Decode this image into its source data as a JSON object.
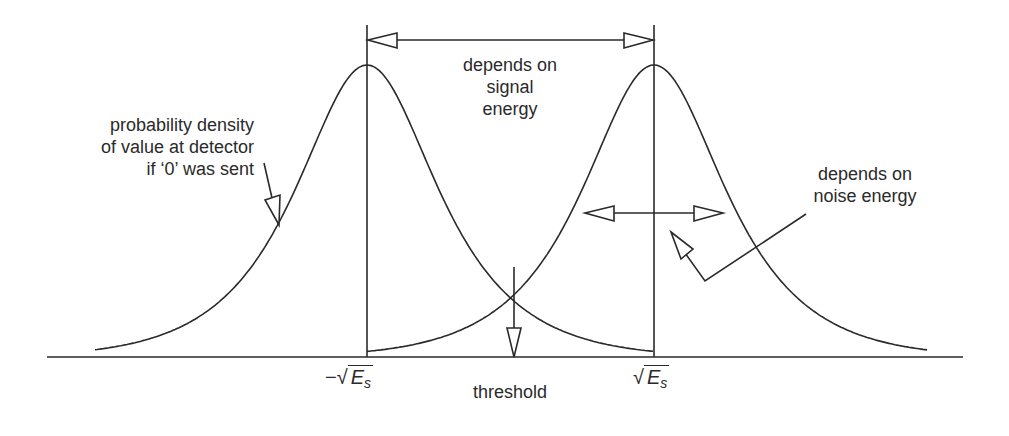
{
  "diagram": {
    "labels": {
      "signal_energy": [
        "depends on",
        "signal",
        "energy"
      ],
      "noise_energy": [
        "depends on",
        "noise energy"
      ],
      "prob_density": [
        "probability density",
        "of value at detector",
        "if ‘0’ was sent"
      ],
      "threshold": "threshold",
      "neg_sqrt_prefix": "−√",
      "pos_sqrt_prefix": "√",
      "energy_symbol": "E",
      "energy_subscript": "s"
    },
    "curves": [
      {
        "name": "bit-0-density",
        "center_x": 367,
        "peak_y": 65
      },
      {
        "name": "bit-1-density",
        "center_x": 654,
        "peak_y": 65
      }
    ],
    "baseline_y": 357,
    "threshold_x": 513,
    "colors": {
      "stroke": "#2a2a2a",
      "background": "#ffffff"
    }
  }
}
